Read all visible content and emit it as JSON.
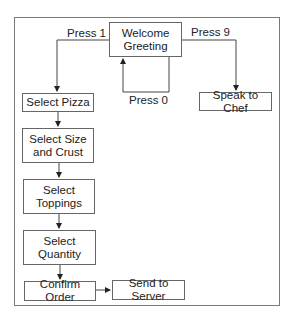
{
  "diagram": {
    "type": "flowchart",
    "nodes": [
      {
        "id": "welcome",
        "label": "Welcome Greeting",
        "lines": [
          "Welcome",
          "Greeting"
        ]
      },
      {
        "id": "pizza",
        "label": "Select Pizza",
        "lines": [
          "Select Pizza"
        ]
      },
      {
        "id": "size",
        "label": "Select Size and Crust",
        "lines": [
          "Select Size",
          "and Crust"
        ]
      },
      {
        "id": "toppings",
        "label": "Select Toppings",
        "lines": [
          "Select",
          "Toppings"
        ]
      },
      {
        "id": "quantity",
        "label": "Select Quantity",
        "lines": [
          "Select",
          "Quantity"
        ]
      },
      {
        "id": "confirm",
        "label": "Confirm Order",
        "lines": [
          "Confirm Order"
        ]
      },
      {
        "id": "server",
        "label": "Send to Server",
        "lines": [
          "Send to Server"
        ]
      },
      {
        "id": "chef",
        "label": "Speak to Chef",
        "lines": [
          "Speak to Chef"
        ]
      }
    ],
    "edges": [
      {
        "from": "welcome",
        "to": "pizza",
        "label": "Press 1"
      },
      {
        "from": "welcome",
        "to": "chef",
        "label": "Press 9"
      },
      {
        "from": "welcome",
        "to": "welcome",
        "label": "Press 0"
      },
      {
        "from": "pizza",
        "to": "size",
        "label": ""
      },
      {
        "from": "size",
        "to": "toppings",
        "label": ""
      },
      {
        "from": "toppings",
        "to": "quantity",
        "label": ""
      },
      {
        "from": "quantity",
        "to": "confirm",
        "label": ""
      },
      {
        "from": "confirm",
        "to": "server",
        "label": ""
      }
    ],
    "edge_labels": {
      "press1": "Press 1",
      "press9": "Press 9",
      "press0": "Press 0"
    }
  }
}
